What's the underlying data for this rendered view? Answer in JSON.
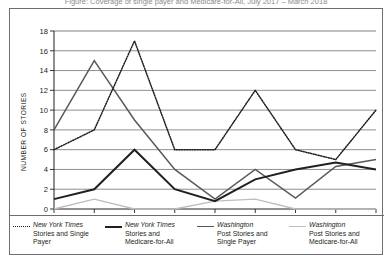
{
  "figure": {
    "title_clipped": "Figure: Coverage of single payer and Medicare-for-All, July 2017 – March 2018"
  },
  "chart_data": {
    "type": "line",
    "title": "",
    "xlabel": "",
    "ylabel": "NUMBER OF STORIES",
    "categories": [
      "Jul.",
      "Aug.",
      "Sep.",
      "Oct.",
      "Nov.",
      "Dec.",
      "Jan .",
      "Feb.",
      "Mar."
    ],
    "yticks": [
      0,
      2,
      4,
      6,
      8,
      10,
      12,
      14,
      16,
      18
    ],
    "ylim": [
      0,
      18
    ],
    "grid": true,
    "legend_position": "bottom",
    "series": [
      {
        "name": "New York Times Stories and Single Payer",
        "style": "dotted",
        "color": "#231f20",
        "values": [
          6,
          8,
          17,
          6,
          6,
          12,
          6,
          5,
          10
        ]
      },
      {
        "name": "New York Times Stories and Medicare-for-All",
        "style": "solid-thick",
        "color": "#231f20",
        "values": [
          1,
          2,
          6,
          2,
          0.8,
          3,
          4,
          4.7,
          4
        ]
      },
      {
        "name": "Washington Post Stories and Single Payer",
        "style": "solid-medium",
        "color": "#58595b",
        "values": [
          8,
          15,
          9,
          4,
          1,
          4,
          1.1,
          4.3,
          5
        ]
      },
      {
        "name": "Washington Post Stories and Medicare-for-All",
        "style": "solid-light",
        "color": "#bcbec0",
        "values": [
          0,
          1,
          0,
          0,
          0.8,
          1,
          0,
          0,
          0
        ]
      }
    ]
  },
  "legend": [
    {
      "swatch": "dotted",
      "lines": [
        "New York Times",
        "Stories and Single",
        "Payer"
      ],
      "italic_line": "New York Times"
    },
    {
      "swatch": "solid-thick",
      "lines": [
        "New York Times",
        "Stories and",
        "Medicare-for-All"
      ],
      "italic_line": "New York Times"
    },
    {
      "swatch": "solid-medium",
      "lines": [
        "Washington",
        "Post Stories and",
        "Single  Payer"
      ],
      "italic_line": "Washington"
    },
    {
      "swatch": "solid-light",
      "lines": [
        "Washington",
        "Post Stories and",
        "Medicare-for-All"
      ],
      "italic_line": "Washington"
    }
  ]
}
